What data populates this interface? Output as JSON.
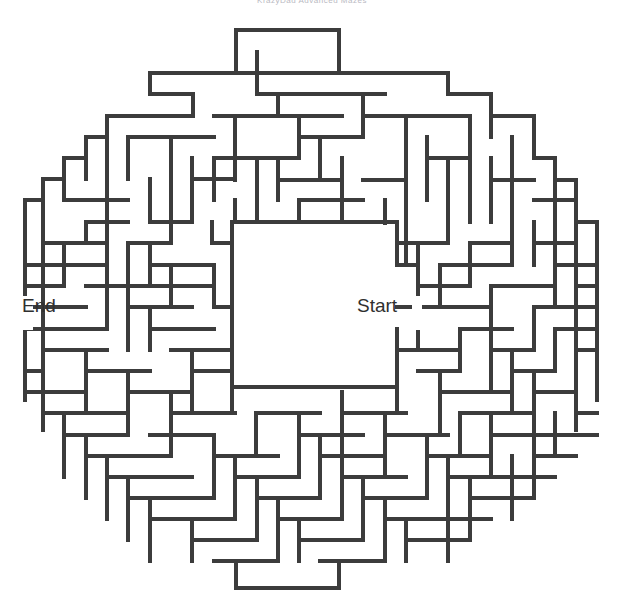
{
  "page": {
    "title": "KrazyDad Advanced Mazes",
    "background_color": "#ffffff"
  },
  "maze": {
    "name": "circular-maze",
    "type": "round-grid-maze",
    "wall_color": "#3c3c3c",
    "wall_thickness_px": 4,
    "cell_size_px": 21.35,
    "grid_cols": 27,
    "grid_rows": 26,
    "origin_x_px": 25,
    "origin_y_px": 30,
    "start_label": "Start",
    "end_label": "End",
    "start_label_x": 357,
    "start_label_y": 312,
    "end_label_x": 22,
    "end_label_y": 312,
    "center_chamber": {
      "x": 232,
      "y": 222,
      "width": 165,
      "height": 165
    },
    "segments": [
      [
        236,
        30,
        339,
        30
      ],
      [
        236,
        30,
        236,
        73
      ],
      [
        339,
        30,
        339,
        73
      ],
      [
        150,
        73,
        448,
        73
      ],
      [
        150,
        73,
        150,
        94
      ],
      [
        448,
        73,
        448,
        94
      ],
      [
        193,
        94,
        150,
        94
      ],
      [
        193,
        94,
        193,
        116
      ],
      [
        448,
        94,
        491,
        94
      ],
      [
        491,
        94,
        491,
        137
      ],
      [
        107,
        116,
        193,
        116
      ],
      [
        107,
        116,
        107,
        158
      ],
      [
        257,
        52,
        257,
        94
      ],
      [
        257,
        94,
        385,
        94
      ],
      [
        278,
        94,
        278,
        116
      ],
      [
        214,
        116,
        342,
        116
      ],
      [
        363,
        94,
        363,
        137
      ],
      [
        363,
        116,
        470,
        116
      ],
      [
        128,
        137,
        214,
        137
      ],
      [
        128,
        137,
        128,
        179
      ],
      [
        86,
        137,
        107,
        137
      ],
      [
        86,
        137,
        86,
        179
      ],
      [
        235,
        116,
        235,
        180
      ],
      [
        299,
        116,
        299,
        158
      ],
      [
        299,
        137,
        363,
        137
      ],
      [
        491,
        116,
        534,
        116
      ],
      [
        534,
        116,
        534,
        158
      ],
      [
        64,
        158,
        86,
        158
      ],
      [
        64,
        158,
        64,
        200
      ],
      [
        171,
        137,
        171,
        243
      ],
      [
        214,
        158,
        214,
        200
      ],
      [
        214,
        158,
        299,
        158
      ],
      [
        320,
        137,
        320,
        180
      ],
      [
        406,
        116,
        406,
        265
      ],
      [
        427,
        137,
        427,
        200
      ],
      [
        470,
        116,
        470,
        222
      ],
      [
        512,
        137,
        512,
        265
      ],
      [
        555,
        158,
        555,
        265
      ],
      [
        534,
        158,
        555,
        158
      ],
      [
        43,
        179,
        64,
        179
      ],
      [
        43,
        179,
        43,
        243
      ],
      [
        107,
        158,
        107,
        265
      ],
      [
        150,
        179,
        150,
        222
      ],
      [
        192,
        158,
        192,
        222
      ],
      [
        192,
        179,
        235,
        179
      ],
      [
        257,
        158,
        257,
        222
      ],
      [
        278,
        158,
        278,
        200
      ],
      [
        278,
        180,
        342,
        180
      ],
      [
        342,
        158,
        342,
        222
      ],
      [
        363,
        180,
        406,
        180
      ],
      [
        448,
        158,
        448,
        243
      ],
      [
        427,
        158,
        470,
        158
      ],
      [
        491,
        180,
        534,
        180
      ],
      [
        491,
        158,
        491,
        222
      ],
      [
        576,
        180,
        576,
        286
      ],
      [
        555,
        180,
        576,
        180
      ],
      [
        25,
        200,
        43,
        200
      ],
      [
        25,
        200,
        25,
        307
      ],
      [
        64,
        200,
        128,
        200
      ],
      [
        86,
        222,
        128,
        222
      ],
      [
        86,
        222,
        86,
        243
      ],
      [
        150,
        222,
        192,
        222
      ],
      [
        235,
        200,
        235,
        222
      ],
      [
        299,
        200,
        299,
        222
      ],
      [
        299,
        200,
        363,
        200
      ],
      [
        385,
        200,
        385,
        243
      ],
      [
        534,
        200,
        576,
        200
      ],
      [
        597,
        222,
        597,
        329
      ],
      [
        576,
        222,
        597,
        222
      ],
      [
        43,
        243,
        107,
        243
      ],
      [
        64,
        265,
        107,
        265
      ],
      [
        64,
        243,
        64,
        286
      ],
      [
        128,
        243,
        171,
        243
      ],
      [
        128,
        243,
        128,
        286
      ],
      [
        212,
        222,
        212,
        243
      ],
      [
        212,
        243,
        232,
        243
      ],
      [
        232,
        222,
        232,
        243
      ],
      [
        232,
        222,
        397,
        222
      ],
      [
        397,
        222,
        397,
        243
      ],
      [
        150,
        265,
        214,
        265
      ],
      [
        150,
        243,
        150,
        286
      ],
      [
        232,
        243,
        232,
        387
      ],
      [
        397,
        243,
        397,
        265
      ],
      [
        418,
        243,
        418,
        307
      ],
      [
        397,
        243,
        448,
        243
      ],
      [
        470,
        243,
        512,
        243
      ],
      [
        470,
        243,
        470,
        286
      ],
      [
        534,
        243,
        576,
        243
      ],
      [
        534,
        222,
        534,
        265
      ],
      [
        25,
        265,
        64,
        265
      ],
      [
        86,
        286,
        128,
        286
      ],
      [
        171,
        265,
        171,
        307
      ],
      [
        171,
        286,
        214,
        286
      ],
      [
        397,
        265,
        418,
        265
      ],
      [
        440,
        265,
        512,
        265
      ],
      [
        440,
        265,
        440,
        307
      ],
      [
        555,
        265,
        597,
        265
      ],
      [
        555,
        265,
        555,
        307
      ],
      [
        25,
        286,
        64,
        286
      ],
      [
        107,
        286,
        171,
        286
      ],
      [
        107,
        265,
        107,
        329
      ],
      [
        214,
        265,
        214,
        307
      ],
      [
        418,
        286,
        470,
        286
      ],
      [
        491,
        286,
        555,
        286
      ],
      [
        491,
        286,
        491,
        329
      ],
      [
        576,
        286,
        597,
        286
      ],
      [
        25,
        307,
        86,
        307
      ],
      [
        128,
        307,
        192,
        307
      ],
      [
        128,
        286,
        128,
        350
      ],
      [
        214,
        307,
        232,
        307
      ],
      [
        397,
        307,
        440,
        307
      ],
      [
        418,
        307,
        418,
        350
      ],
      [
        440,
        307,
        491,
        307
      ],
      [
        534,
        307,
        597,
        307
      ],
      [
        534,
        307,
        534,
        350
      ],
      [
        25,
        329,
        107,
        329
      ],
      [
        150,
        329,
        214,
        329
      ],
      [
        150,
        307,
        150,
        350
      ],
      [
        232,
        329,
        232,
        350
      ],
      [
        460,
        329,
        512,
        329
      ],
      [
        460,
        329,
        460,
        371
      ],
      [
        555,
        329,
        597,
        329
      ],
      [
        555,
        329,
        555,
        371
      ],
      [
        43,
        350,
        107,
        350
      ],
      [
        43,
        329,
        43,
        392
      ],
      [
        171,
        350,
        232,
        350
      ],
      [
        397,
        350,
        460,
        350
      ],
      [
        397,
        329,
        397,
        387
      ],
      [
        491,
        350,
        534,
        350
      ],
      [
        491,
        329,
        491,
        392
      ],
      [
        25,
        371,
        43,
        371
      ],
      [
        86,
        371,
        150,
        371
      ],
      [
        86,
        350,
        86,
        413
      ],
      [
        192,
        371,
        232,
        371
      ],
      [
        192,
        350,
        192,
        413
      ],
      [
        418,
        371,
        460,
        371
      ],
      [
        512,
        371,
        555,
        371
      ],
      [
        512,
        350,
        512,
        413
      ],
      [
        576,
        350,
        597,
        350
      ],
      [
        576,
        350,
        576,
        413
      ],
      [
        25,
        392,
        86,
        392
      ],
      [
        128,
        392,
        192,
        392
      ],
      [
        128,
        371,
        128,
        435
      ],
      [
        232,
        387,
        397,
        387
      ],
      [
        232,
        387,
        232,
        413
      ],
      [
        397,
        387,
        397,
        413
      ],
      [
        440,
        392,
        512,
        392
      ],
      [
        440,
        371,
        440,
        435
      ],
      [
        534,
        392,
        576,
        392
      ],
      [
        534,
        371,
        534,
        435
      ],
      [
        43,
        413,
        128,
        413
      ],
      [
        171,
        413,
        235,
        413
      ],
      [
        171,
        392,
        171,
        456
      ],
      [
        256,
        413,
        320,
        413
      ],
      [
        256,
        413,
        256,
        456
      ],
      [
        342,
        413,
        406,
        413
      ],
      [
        342,
        392,
        342,
        456
      ],
      [
        460,
        413,
        534,
        413
      ],
      [
        460,
        413,
        460,
        456
      ],
      [
        576,
        413,
        597,
        413
      ],
      [
        64,
        435,
        128,
        435
      ],
      [
        64,
        413,
        64,
        477
      ],
      [
        150,
        435,
        214,
        435
      ],
      [
        299,
        435,
        363,
        435
      ],
      [
        299,
        413,
        299,
        477
      ],
      [
        385,
        435,
        448,
        435
      ],
      [
        385,
        413,
        385,
        477
      ],
      [
        491,
        435,
        555,
        435
      ],
      [
        491,
        413,
        491,
        477
      ],
      [
        555,
        435,
        597,
        435
      ],
      [
        555,
        413,
        555,
        456
      ],
      [
        86,
        456,
        171,
        456
      ],
      [
        86,
        435,
        86,
        498
      ],
      [
        214,
        456,
        278,
        456
      ],
      [
        214,
        435,
        214,
        498
      ],
      [
        320,
        456,
        385,
        456
      ],
      [
        320,
        435,
        320,
        498
      ],
      [
        427,
        456,
        491,
        456
      ],
      [
        427,
        435,
        427,
        498
      ],
      [
        534,
        456,
        576,
        456
      ],
      [
        534,
        435,
        534,
        498
      ],
      [
        107,
        477,
        192,
        477
      ],
      [
        107,
        456,
        107,
        519
      ],
      [
        235,
        477,
        299,
        477
      ],
      [
        235,
        456,
        235,
        519
      ],
      [
        342,
        477,
        406,
        477
      ],
      [
        342,
        456,
        342,
        519
      ],
      [
        448,
        477,
        512,
        477
      ],
      [
        448,
        456,
        448,
        519
      ],
      [
        512,
        477,
        555,
        477
      ],
      [
        512,
        456,
        512,
        519
      ],
      [
        128,
        498,
        214,
        498
      ],
      [
        128,
        477,
        128,
        540
      ],
      [
        257,
        498,
        320,
        498
      ],
      [
        257,
        477,
        257,
        540
      ],
      [
        363,
        498,
        427,
        498
      ],
      [
        363,
        477,
        363,
        540
      ],
      [
        470,
        498,
        534,
        498
      ],
      [
        470,
        477,
        470,
        540
      ],
      [
        150,
        519,
        235,
        519
      ],
      [
        150,
        498,
        150,
        561
      ],
      [
        278,
        519,
        342,
        519
      ],
      [
        278,
        498,
        278,
        561
      ],
      [
        385,
        519,
        448,
        519
      ],
      [
        385,
        498,
        385,
        561
      ],
      [
        448,
        519,
        491,
        519
      ],
      [
        448,
        498,
        448,
        561
      ],
      [
        192,
        540,
        257,
        540
      ],
      [
        192,
        519,
        192,
        561
      ],
      [
        299,
        540,
        363,
        540
      ],
      [
        299,
        519,
        299,
        561
      ],
      [
        406,
        540,
        470,
        540
      ],
      [
        406,
        519,
        406,
        561
      ],
      [
        214,
        561,
        278,
        561
      ],
      [
        236,
        561,
        236,
        588
      ],
      [
        339,
        561,
        339,
        588
      ],
      [
        236,
        588,
        339,
        588
      ],
      [
        320,
        561,
        385,
        561
      ],
      [
        25,
        200,
        25,
        400
      ],
      [
        597,
        222,
        597,
        400
      ],
      [
        43,
        179,
        43,
        430
      ],
      [
        576,
        180,
        576,
        430
      ]
    ]
  }
}
